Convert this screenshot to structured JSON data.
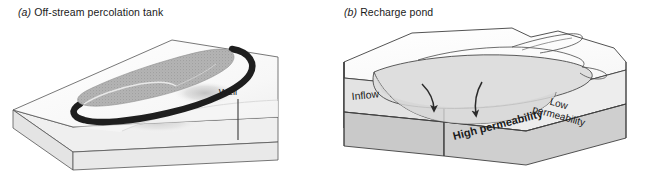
{
  "figure": {
    "background_color": "#ffffff",
    "panels": [
      {
        "id": "a",
        "enumerator": "(a)",
        "title": "Off-stream percolation tank",
        "labels": {
          "well": "Well"
        },
        "colors": {
          "block_top": "#fbfbfb",
          "block_front": "#f0f0f0",
          "block_side": "#e6e6e6",
          "tank_fill": "#b0b0b0",
          "embankment": "#1e1e1e",
          "mound_shadow": "#cfcfcf",
          "outline": "#4a4a4a",
          "well_line": "#3a3a3a"
        }
      },
      {
        "id": "b",
        "enumerator": "(b)",
        "title": "Recharge pond",
        "labels": {
          "inflow": "Inflow",
          "low_permeability_line1": "Low",
          "low_permeability_line2": "permeability",
          "high_permeability": "High permeability"
        },
        "colors": {
          "block_top": "#fcfcfc",
          "low_perm_layer": "#e3e3e3",
          "high_perm_layer": "#c9c9c9",
          "pond_fill": "#dcdcdc",
          "outline": "#3f3f3f",
          "arrow": "#2a2a2a"
        }
      }
    ]
  }
}
